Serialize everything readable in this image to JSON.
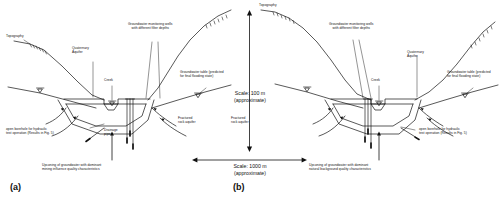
{
  "figure": {
    "type": "hydrogeological-cross-section"
  },
  "panels": [
    {
      "tag": "(a)",
      "labels": {
        "topography": "Topography",
        "quaternary_aquifer": "Quaternary\nAquifer",
        "monitoring_wells": "Groundwater monitoring wells\nwith different filter depths",
        "creek": "Creek",
        "drainage_pipe": "Drainage\npipe",
        "groundwater_table": "Groundwater table (predicted\nfor final flooding state)",
        "fractured_rock": "Fractured\nrock aquifer",
        "open_borehole": "open borehole for hydraulic\ntest operation (Results in Fig. 5)",
        "upconing": "Upconing of groundwater with dominant\nmining influence quality characteristics"
      }
    },
    {
      "tag": "(b)",
      "labels": {
        "topography": "Topography",
        "quaternary_aquifer": "Quaternary\nAquifer",
        "monitoring_wells": "Groundwater monitoring wells\nwith different filter depths",
        "creek": "Creek",
        "groundwater_table": "Groundwater table (predicted\nfor final flooding state)",
        "fractured_rock": "Fractured\nrock aquifer",
        "open_borehole": "open borehole for hydraulic\ntest operation (Results in Fig. 5)",
        "upconing": "Upconing of groundwater with dominant\nnatural background quality characteristics"
      }
    }
  ],
  "scales": {
    "vertical": "Scale: 100 m\n(approximate)",
    "horizontal": "Scale: 1000 m\n(approximate)"
  },
  "colors": {
    "line": "#111111",
    "background": "#ffffff"
  }
}
